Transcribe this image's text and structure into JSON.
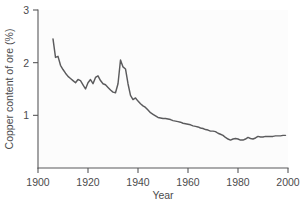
{
  "chart_data": {
    "type": "line",
    "title": "",
    "subtitle": "",
    "xlabel": "Year",
    "ylabel": "Copper content of ore (%)",
    "xlim": [
      1900,
      2000
    ],
    "ylim": [
      0,
      3
    ],
    "xticks": [
      1900,
      1920,
      1940,
      1960,
      1980,
      2000
    ],
    "xticklabels": [
      "1900",
      "1920",
      "1940",
      "1960",
      "1980",
      "2000"
    ],
    "yticks": [
      1,
      2,
      3
    ],
    "yticklabels": [
      "1",
      "2",
      "3"
    ],
    "grid": false,
    "legend": null,
    "line_color": "#5b5b5d",
    "background_color": "#fcfcfc",
    "annotations": [],
    "series": [
      {
        "name": "Copper content of ore",
        "units": "%",
        "x": [
          1906,
          1907,
          1908,
          1909,
          1910,
          1911,
          1912,
          1913,
          1914,
          1915,
          1916,
          1917,
          1918,
          1919,
          1920,
          1921,
          1922,
          1923,
          1924,
          1925,
          1926,
          1927,
          1928,
          1929,
          1930,
          1931,
          1932,
          1933,
          1934,
          1935,
          1936,
          1937,
          1938,
          1939,
          1940,
          1941,
          1942,
          1943,
          1944,
          1945,
          1946,
          1947,
          1948,
          1949,
          1950,
          1951,
          1952,
          1953,
          1954,
          1955,
          1956,
          1957,
          1958,
          1959,
          1960,
          1961,
          1962,
          1963,
          1964,
          1965,
          1966,
          1967,
          1968,
          1969,
          1970,
          1971,
          1972,
          1973,
          1974,
          1975,
          1976,
          1977,
          1978,
          1979,
          1980,
          1981,
          1982,
          1983,
          1984,
          1985,
          1986,
          1987,
          1988,
          1989,
          1990,
          1991,
          1992,
          1993,
          1994,
          1995,
          1996,
          1997,
          1998,
          1999
        ],
        "values": [
          2.45,
          2.1,
          2.12,
          1.95,
          1.87,
          1.8,
          1.74,
          1.7,
          1.66,
          1.62,
          1.68,
          1.66,
          1.58,
          1.5,
          1.62,
          1.68,
          1.6,
          1.72,
          1.75,
          1.66,
          1.6,
          1.58,
          1.53,
          1.48,
          1.44,
          1.43,
          1.6,
          2.05,
          1.92,
          1.88,
          1.6,
          1.38,
          1.3,
          1.33,
          1.27,
          1.22,
          1.18,
          1.15,
          1.1,
          1.05,
          1.02,
          0.99,
          0.96,
          0.95,
          0.94,
          0.94,
          0.93,
          0.92,
          0.9,
          0.89,
          0.88,
          0.87,
          0.85,
          0.84,
          0.83,
          0.82,
          0.8,
          0.79,
          0.78,
          0.76,
          0.75,
          0.73,
          0.72,
          0.7,
          0.7,
          0.69,
          0.66,
          0.64,
          0.62,
          0.58,
          0.55,
          0.53,
          0.55,
          0.56,
          0.55,
          0.53,
          0.53,
          0.55,
          0.58,
          0.56,
          0.55,
          0.57,
          0.6,
          0.59,
          0.59,
          0.6,
          0.6,
          0.6,
          0.6,
          0.61,
          0.61,
          0.61,
          0.62,
          0.62
        ]
      }
    ]
  }
}
